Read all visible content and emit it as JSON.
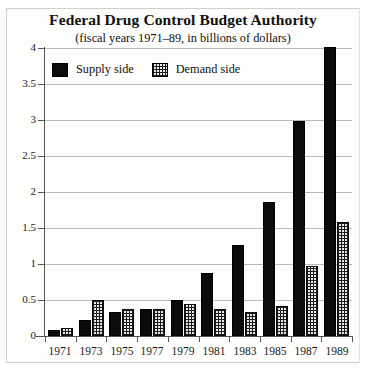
{
  "chart_data": {
    "type": "bar",
    "title": "Federal Drug Control Budget Authority",
    "subtitle": "(fiscal years 1971–89, in billions of dollars)",
    "xlabel": "",
    "ylabel": "",
    "ylim": [
      0,
      4
    ],
    "ytick_labels": [
      "0",
      "0.5",
      "1",
      "1.5",
      "2",
      "2.5",
      "3",
      "3.5",
      "4"
    ],
    "ytick_values": [
      0,
      0.5,
      1,
      1.5,
      2,
      2.5,
      3,
      3.5,
      4
    ],
    "grid": true,
    "legend_position": "top-left-inside",
    "categories": [
      "1971",
      "1973",
      "1975",
      "1977",
      "1979",
      "1981",
      "1983",
      "1985",
      "1987",
      "1989"
    ],
    "series": [
      {
        "name": "Supply side",
        "color": "#0b0b0b",
        "pattern": "solid",
        "values": [
          0.08,
          0.22,
          0.33,
          0.37,
          0.5,
          0.87,
          1.27,
          1.86,
          2.98,
          4.02
        ]
      },
      {
        "name": "Demand side",
        "color": "#e9e9e6",
        "pattern": "grid-hatch",
        "values": [
          0.11,
          0.5,
          0.38,
          0.37,
          0.44,
          0.37,
          0.33,
          0.42,
          0.97,
          1.58
        ]
      }
    ]
  },
  "colors": {
    "supply": "#0b0b0b",
    "demand": "#e9e9e6",
    "gridline": "#b9b9b6",
    "axis": "#555555",
    "background": "#fdfdfc"
  }
}
